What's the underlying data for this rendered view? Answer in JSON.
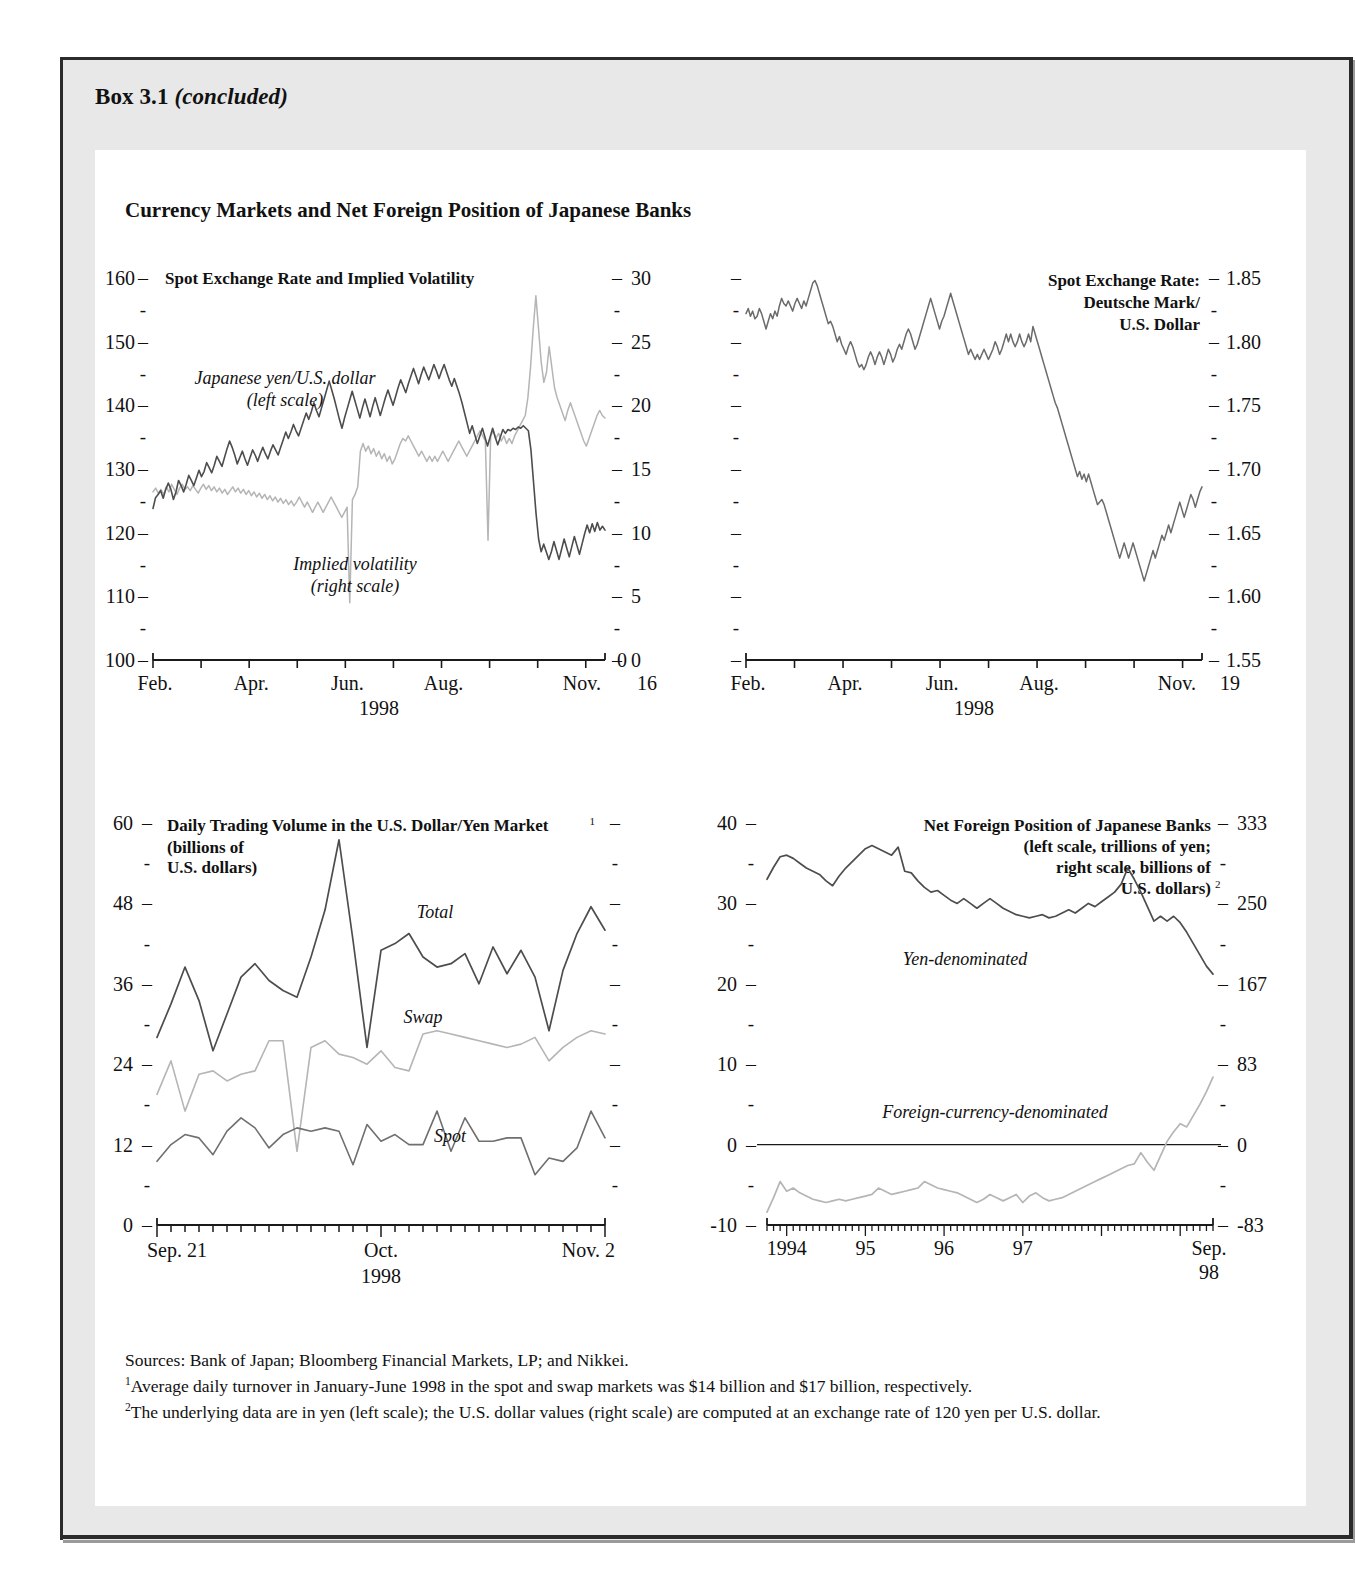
{
  "box": {
    "label": "Box 3.1",
    "status": "(concluded)",
    "panel_title": "Currency Markets and Net Foreign Position of Japanese Banks"
  },
  "sources": {
    "line1": "Sources:  Bank of Japan; Bloomberg Financial Markets, LP; and Nikkei.",
    "fn1_marker": "1",
    "fn1": "Average daily turnover in January-June 1998 in the spot and swap markets was $14 billion and $17 billion, respectively.",
    "fn2_marker": "2",
    "fn2": "The underlying data are in yen (left scale); the U.S. dollar values (right scale) are computed at an exchange rate of 120 yen per U.S. dollar."
  },
  "colors": {
    "dark_line": "#4d4d4d",
    "light_line": "#b5b5b5",
    "axis": "#1a1a1a",
    "box_bg": "#e8e8e8",
    "panel_bg": "#ffffff"
  },
  "chart_data": [
    {
      "id": "spot-exchange-rate-implied-volatility",
      "type": "line",
      "title": "Spot Exchange Rate and Implied Volatility",
      "xlabel": "1998",
      "x_ticks": [
        "Feb.",
        "Apr.",
        "Jun.",
        "Aug.",
        "Nov."
      ],
      "x_end_label": "Nov.",
      "left_ticks": [
        100,
        110,
        120,
        130,
        140,
        150,
        160
      ],
      "right_ticks": [
        0,
        5,
        10,
        15,
        20,
        25,
        30
      ],
      "ylim_left": [
        100,
        160
      ],
      "ylim_right": [
        0,
        30
      ],
      "legend_position": "in-plot",
      "grid": false,
      "series": [
        {
          "name": "Japanese yen/U.S. dollar",
          "scale_note": "(left scale)",
          "axis": "left",
          "color": "#4d4d4d",
          "values": [
            123.8,
            125.5,
            126.0,
            126.6,
            125.4,
            126.8,
            127.8,
            126.8,
            125.2,
            126.4,
            128.2,
            127.4,
            126.4,
            127.6,
            129.0,
            128.2,
            127.4,
            128.6,
            129.8,
            128.8,
            129.6,
            131.0,
            130.2,
            129.4,
            130.6,
            132.0,
            131.2,
            130.4,
            131.8,
            133.2,
            134.4,
            133.4,
            132.2,
            130.8,
            131.8,
            132.8,
            131.6,
            130.6,
            131.8,
            133.0,
            132.2,
            131.2,
            132.4,
            133.4,
            132.4,
            131.6,
            132.8,
            133.8,
            133.0,
            132.2,
            133.4,
            134.6,
            135.8,
            134.8,
            135.8,
            137.0,
            136.0,
            135.2,
            136.4,
            137.6,
            138.8,
            137.8,
            139.0,
            140.4,
            139.2,
            138.2,
            139.6,
            141.0,
            142.4,
            143.8,
            142.4,
            141.0,
            139.4,
            137.8,
            136.4,
            138.0,
            139.4,
            140.8,
            142.2,
            140.8,
            139.4,
            138.0,
            139.6,
            141.0,
            139.6,
            138.2,
            139.8,
            141.2,
            139.8,
            138.4,
            139.8,
            141.2,
            142.4,
            141.2,
            140.0,
            141.4,
            142.8,
            144.0,
            143.0,
            142.0,
            143.4,
            144.6,
            145.8,
            144.6,
            143.4,
            144.8,
            146.0,
            145.0,
            144.0,
            145.2,
            146.4,
            145.4,
            144.2,
            145.4,
            146.4,
            145.2,
            144.0,
            143.0,
            144.2,
            143.0,
            141.8,
            140.4,
            138.8,
            137.2,
            135.6,
            136.8,
            135.4,
            134.0,
            135.2,
            136.4,
            135.0,
            133.6,
            135.0,
            136.4,
            135.0,
            133.8,
            135.0,
            136.2,
            135.6,
            136.2,
            136.0,
            136.4,
            136.2,
            136.6,
            136.4,
            136.8,
            136.4,
            136.0,
            133.0,
            128.0,
            123.0,
            119.0,
            117.0,
            118.2,
            117.0,
            115.8,
            117.0,
            118.6,
            117.2,
            115.8,
            117.4,
            119.0,
            117.6,
            116.2,
            117.8,
            119.4,
            118.0,
            116.6,
            118.2,
            119.8,
            121.2,
            120.0,
            121.4,
            120.2,
            121.6,
            120.4,
            121.0,
            120.4
          ]
        },
        {
          "name": "Implied volatility",
          "scale_note": "(right scale)",
          "axis": "right",
          "color": "#b5b5b5",
          "values": [
            13.2,
            13.5,
            13.1,
            13.4,
            13.0,
            13.6,
            13.2,
            13.8,
            13.4,
            13.0,
            13.5,
            13.8,
            13.4,
            13.6,
            13.3,
            13.7,
            13.4,
            13.1,
            13.5,
            13.8,
            13.4,
            13.7,
            13.3,
            13.6,
            13.2,
            13.5,
            13.1,
            13.4,
            13.0,
            13.3,
            13.6,
            13.2,
            13.5,
            13.1,
            13.4,
            13.0,
            13.3,
            12.9,
            13.2,
            12.8,
            13.1,
            12.7,
            13.0,
            12.6,
            12.9,
            12.5,
            12.8,
            12.4,
            12.7,
            12.3,
            12.6,
            12.2,
            12.5,
            12.1,
            12.4,
            12.8,
            12.4,
            12.0,
            12.4,
            12.0,
            11.6,
            12.0,
            12.4,
            12.0,
            11.6,
            12.0,
            12.4,
            12.8,
            12.4,
            12.0,
            11.6,
            11.2,
            11.6,
            12.0,
            4.5,
            12.6,
            13.0,
            13.6,
            16.4,
            17.0,
            16.4,
            16.8,
            16.2,
            16.6,
            16.0,
            16.4,
            15.8,
            16.2,
            15.6,
            16.0,
            15.4,
            15.8,
            16.4,
            17.0,
            17.4,
            17.2,
            17.6,
            17.2,
            16.8,
            16.4,
            16.0,
            16.4,
            16.0,
            15.6,
            16.0,
            15.6,
            16.0,
            15.6,
            16.0,
            16.4,
            16.0,
            15.6,
            16.0,
            16.4,
            16.8,
            17.2,
            16.8,
            16.4,
            16.0,
            16.4,
            16.8,
            17.2,
            17.6,
            18.0,
            17.6,
            17.2,
            9.4,
            17.6,
            18.0,
            17.4,
            17.8,
            17.2,
            17.6,
            17.0,
            17.4,
            17.0,
            17.6,
            18.0,
            18.4,
            18.8,
            19.2,
            20.6,
            23.0,
            26.0,
            28.6,
            26.0,
            23.4,
            21.8,
            22.6,
            24.6,
            23.0,
            21.4,
            20.6,
            20.0,
            19.4,
            18.8,
            19.6,
            20.2,
            19.6,
            19.0,
            18.4,
            17.8,
            17.2,
            16.8,
            17.4,
            18.0,
            18.6,
            19.2,
            19.6,
            19.2,
            19.0
          ]
        }
      ]
    },
    {
      "id": "spot-exchange-rate-deutsche-mark",
      "type": "line",
      "title_lines": [
        "Spot Exchange Rate:",
        "Deutsche Mark/",
        "U.S. Dollar"
      ],
      "xlabel": "1998",
      "x_ticks": [
        "Feb.",
        "Apr.",
        "Jun.",
        "Aug.",
        "Nov."
      ],
      "x_end_label": "Nov.",
      "right_ticks": [
        1.55,
        1.6,
        1.65,
        1.7,
        1.75,
        1.8,
        1.85
      ],
      "ylim": [
        1.55,
        1.85
      ],
      "grid": false,
      "series": [
        {
          "name": "Deutsche Mark/U.S. Dollar",
          "color": "#6b6b6b",
          "values": [
            1.822,
            1.826,
            1.82,
            1.824,
            1.818,
            1.82,
            1.826,
            1.822,
            1.816,
            1.81,
            1.816,
            1.822,
            1.818,
            1.824,
            1.82,
            1.828,
            1.834,
            1.83,
            1.828,
            1.832,
            1.828,
            1.824,
            1.83,
            1.834,
            1.83,
            1.826,
            1.832,
            1.828,
            1.834,
            1.84,
            1.846,
            1.848,
            1.844,
            1.838,
            1.832,
            1.826,
            1.82,
            1.814,
            1.816,
            1.812,
            1.806,
            1.8,
            1.804,
            1.798,
            1.794,
            1.79,
            1.796,
            1.8,
            1.796,
            1.79,
            1.784,
            1.78,
            1.782,
            1.778,
            1.782,
            1.788,
            1.792,
            1.788,
            1.782,
            1.788,
            1.792,
            1.788,
            1.782,
            1.788,
            1.794,
            1.79,
            1.784,
            1.788,
            1.794,
            1.798,
            1.794,
            1.8,
            1.806,
            1.81,
            1.806,
            1.8,
            1.794,
            1.798,
            1.804,
            1.81,
            1.816,
            1.822,
            1.828,
            1.834,
            1.828,
            1.822,
            1.816,
            1.81,
            1.816,
            1.82,
            1.826,
            1.832,
            1.838,
            1.832,
            1.826,
            1.82,
            1.814,
            1.808,
            1.802,
            1.796,
            1.79,
            1.794,
            1.79,
            1.786,
            1.79,
            1.786,
            1.79,
            1.794,
            1.79,
            1.786,
            1.79,
            1.794,
            1.8,
            1.796,
            1.79,
            1.794,
            1.8,
            1.806,
            1.8,
            1.806,
            1.8,
            1.796,
            1.8,
            1.806,
            1.8,
            1.796,
            1.8,
            1.806,
            1.8,
            1.812,
            1.806,
            1.8,
            1.794,
            1.788,
            1.782,
            1.776,
            1.77,
            1.764,
            1.758,
            1.752,
            1.748,
            1.742,
            1.736,
            1.73,
            1.724,
            1.718,
            1.712,
            1.706,
            1.7,
            1.694,
            1.698,
            1.692,
            1.696,
            1.69,
            1.696,
            1.69,
            1.684,
            1.678,
            1.672,
            1.674,
            1.676,
            1.672,
            1.666,
            1.66,
            1.654,
            1.648,
            1.642,
            1.636,
            1.63,
            1.636,
            1.642,
            1.636,
            1.63,
            1.636,
            1.642,
            1.636,
            1.63,
            1.624,
            1.618,
            1.612,
            1.618,
            1.624,
            1.63,
            1.636,
            1.63,
            1.636,
            1.642,
            1.648,
            1.644,
            1.65,
            1.656,
            1.65,
            1.656,
            1.662,
            1.668,
            1.674,
            1.668,
            1.662,
            1.668,
            1.674,
            1.68,
            1.676,
            1.67,
            1.676,
            1.682,
            1.686
          ]
        }
      ]
    },
    {
      "id": "daily-trading-volume-usd-yen",
      "type": "line",
      "title": "Daily Trading Volume in the U.S. Dollar/Yen Market",
      "title_sup": "1",
      "subtitle_lines": [
        "(billions of",
        "U.S. dollars)"
      ],
      "xlabel": "1998",
      "x_start_label": "Sep. 21",
      "x_mid_label": "Oct.",
      "x_end_label": "Nov. 2",
      "left_ticks": [
        0,
        12,
        24,
        36,
        48,
        60
      ],
      "ylim": [
        0,
        60
      ],
      "grid": false,
      "series": [
        {
          "name": "Total",
          "color": "#4d4d4d",
          "values": [
            28.0,
            33.0,
            38.5,
            33.5,
            26.0,
            31.5,
            37.0,
            39.0,
            36.5,
            35.0,
            34.0,
            40.0,
            47.0,
            57.5,
            42.5,
            26.5,
            41.0,
            42.0,
            43.5,
            40.0,
            38.5,
            39.0,
            40.5,
            36.0,
            41.5,
            37.5,
            41.0,
            37.0,
            29.0,
            38.0,
            43.5,
            47.5,
            44.0
          ]
        },
        {
          "name": "Swap",
          "color": "#b5b5b5",
          "values": [
            19.5,
            24.5,
            17.0,
            22.5,
            23.0,
            21.5,
            22.5,
            23.0,
            27.5,
            27.5,
            11.0,
            26.5,
            27.5,
            25.5,
            25.0,
            24.0,
            26.0,
            23.5,
            23.0,
            28.5,
            29.0,
            28.5,
            28.0,
            27.5,
            27.0,
            26.5,
            27.0,
            28.0,
            24.5,
            26.5,
            28.0,
            29.0,
            28.5
          ]
        },
        {
          "name": "Spot",
          "color": "#6f6f6f",
          "values": [
            9.5,
            12.0,
            13.5,
            13.0,
            10.5,
            14.0,
            16.0,
            14.5,
            11.5,
            13.5,
            14.5,
            14.0,
            14.5,
            14.0,
            9.0,
            15.0,
            12.5,
            13.5,
            12.0,
            12.0,
            17.0,
            11.0,
            16.0,
            12.5,
            12.5,
            13.0,
            13.0,
            7.5,
            10.0,
            9.5,
            11.5,
            17.0,
            13.0
          ]
        }
      ]
    },
    {
      "id": "net-foreign-position-japanese-banks",
      "type": "line",
      "title_lines": [
        "Net Foreign Position of Japanese Banks",
        "(left scale, trillions of yen;",
        "right scale, billions of",
        "U.S. dollars)"
      ],
      "title_sup": "2",
      "x_ticks": [
        "1994",
        "95",
        "96",
        "97",
        "Sep."
      ],
      "x_end_sub": "98",
      "left_ticks": [
        -10,
        0,
        10,
        20,
        30,
        40
      ],
      "right_ticks": [
        -83,
        0,
        83,
        167,
        250,
        333
      ],
      "ylim_left": [
        -10,
        40
      ],
      "ylim_right": [
        -83,
        333
      ],
      "zero_line": true,
      "grid": false,
      "series": [
        {
          "name": "Yen-denominated",
          "color": "#4d4d4d",
          "values": [
            33.0,
            34.5,
            35.8,
            36.0,
            35.6,
            35.0,
            34.4,
            34.0,
            33.6,
            32.8,
            32.2,
            33.4,
            34.4,
            35.2,
            36.0,
            36.8,
            37.2,
            36.8,
            36.4,
            36.0,
            37.0,
            34.0,
            33.8,
            32.8,
            32.0,
            31.4,
            31.6,
            31.0,
            30.4,
            30.0,
            30.6,
            30.0,
            29.4,
            30.0,
            30.6,
            30.0,
            29.4,
            29.0,
            28.6,
            28.4,
            28.2,
            28.4,
            28.6,
            28.2,
            28.4,
            28.8,
            29.2,
            28.8,
            29.4,
            30.0,
            29.6,
            30.2,
            30.8,
            31.4,
            32.4,
            34.4,
            33.0,
            31.4,
            29.6,
            27.8,
            28.4,
            27.8,
            28.4,
            27.6,
            26.4,
            25.0,
            23.6,
            22.2,
            21.2
          ]
        },
        {
          "name": "Foreign-currency-denominated",
          "color": "#b5b5b5",
          "values": [
            -8.4,
            -6.6,
            -4.6,
            -5.8,
            -5.4,
            -6.0,
            -6.4,
            -6.8,
            -7.0,
            -7.2,
            -7.0,
            -6.8,
            -7.0,
            -6.8,
            -6.6,
            -6.4,
            -6.2,
            -5.4,
            -5.8,
            -6.2,
            -6.0,
            -5.8,
            -5.6,
            -5.4,
            -4.6,
            -5.0,
            -5.4,
            -5.6,
            -5.8,
            -6.0,
            -6.4,
            -6.8,
            -7.2,
            -6.8,
            -6.2,
            -6.6,
            -7.0,
            -6.6,
            -6.2,
            -7.2,
            -6.4,
            -6.0,
            -6.6,
            -7.0,
            -6.8,
            -6.6,
            -6.2,
            -5.8,
            -5.4,
            -5.0,
            -4.6,
            -4.2,
            -3.8,
            -3.4,
            -3.0,
            -2.6,
            -2.4,
            -1.0,
            -2.2,
            -3.2,
            -1.4,
            0.4,
            1.6,
            2.6,
            2.2,
            3.6,
            5.0,
            6.6,
            8.4
          ]
        }
      ]
    }
  ]
}
